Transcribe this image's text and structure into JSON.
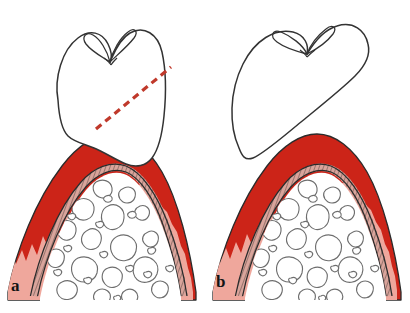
{
  "figure": {
    "type": "medical-illustration",
    "background_color": "#ffffff",
    "width": 410,
    "height": 313
  },
  "palette": {
    "gingiva_dark_red": "#CC2418",
    "gingiva_light_pink": "#EFA79C",
    "pdl_band_fill": "#D9A49B",
    "outline_dark": "#2B2B2B",
    "bone_outline_gray": "#6E6E6E",
    "bone_fill": "#FFFFFF",
    "tooth_fill": "#FFFFFF",
    "tooth_outline": "#333333",
    "dashed_line_red": "#C0392B",
    "label_color": "#141414"
  },
  "panels": [
    {
      "id": "a",
      "label": "a",
      "caption_label": "a",
      "tooth_state": "intact crown seated, sectioning line indicated",
      "has_dashed_section_line": true,
      "gingiva_margin": "smooth, covered by crown",
      "dashed_line": {
        "color": "#C0392B",
        "from_x": 96,
        "from_y": 129,
        "to_x": 171,
        "to_y": 67,
        "dash_pattern": "7 5",
        "width": 3.2
      },
      "structures": [
        "enamel-crown",
        "gingiva-dark-red",
        "gingiva-light-pink",
        "periodontal-ligament-band",
        "alveolar-trabecular-bone"
      ]
    },
    {
      "id": "b",
      "label": "b",
      "caption_label": "b",
      "tooth_state": "crown tilted / displaced along section plane",
      "has_dashed_section_line": false,
      "gingiva_margin": "exposed sawtooth crest",
      "structures": [
        "enamel-crown-tilted",
        "gingiva-dark-red",
        "gingiva-light-pink",
        "periodontal-ligament-band",
        "alveolar-trabecular-bone"
      ]
    }
  ]
}
